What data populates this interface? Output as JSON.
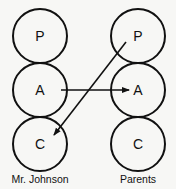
{
  "diagram": {
    "type": "transactional-analysis",
    "left": {
      "label": "Mr. Johnson",
      "states": [
        {
          "letter": "P"
        },
        {
          "letter": "A"
        },
        {
          "letter": "C"
        }
      ]
    },
    "right": {
      "label": "Parents",
      "states": [
        {
          "letter": "P"
        },
        {
          "letter": "A"
        },
        {
          "letter": "C"
        }
      ]
    },
    "arrows": [
      {
        "from": "Mr. Johnson A",
        "to": "Parents A"
      },
      {
        "from": "Parents P",
        "to": "Mr. Johnson C"
      }
    ],
    "colors": {
      "stroke": "#111111",
      "background": "#f7f7f5"
    }
  }
}
